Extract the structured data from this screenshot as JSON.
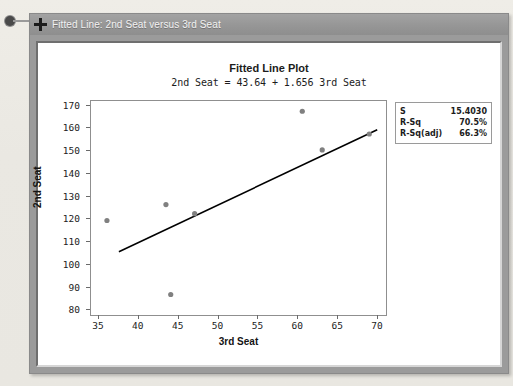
{
  "window": {
    "title": "Fitted Line: 2nd Seat versus 3rd Seat",
    "move_icon": "move-cross-icon"
  },
  "chart_data": {
    "type": "scatter",
    "title": "Fitted Line Plot",
    "subtitle": "2nd Seat = 43.64 + 1.656 3rd Seat",
    "xlabel": "3rd Seat",
    "ylabel": "2nd Seat",
    "xlim": [
      34,
      71
    ],
    "ylim": [
      78,
      172
    ],
    "xticks": [
      35,
      40,
      45,
      50,
      55,
      60,
      65,
      70
    ],
    "yticks": [
      80,
      90,
      100,
      110,
      120,
      130,
      140,
      150,
      160,
      170
    ],
    "grid": false,
    "legend": "none",
    "marker_color": "#808080",
    "line_color": "#000000",
    "points": [
      {
        "x": 36.0,
        "y": 119.5
      },
      {
        "x": 43.4,
        "y": 126.5
      },
      {
        "x": 44.0,
        "y": 87.0
      },
      {
        "x": 47.0,
        "y": 122.5
      },
      {
        "x": 60.5,
        "y": 167.5
      },
      {
        "x": 63.0,
        "y": 150.5
      },
      {
        "x": 68.9,
        "y": 157.5
      }
    ],
    "fit_line": {
      "intercept": 43.64,
      "slope": 1.656,
      "x_start": 37.5,
      "x_end": 69.9
    },
    "stats": [
      {
        "key": "S",
        "value": "15.4030"
      },
      {
        "key": "R-Sq",
        "value": "70.5%"
      },
      {
        "key": "R-Sq(adj)",
        "value": "66.3%"
      }
    ]
  }
}
